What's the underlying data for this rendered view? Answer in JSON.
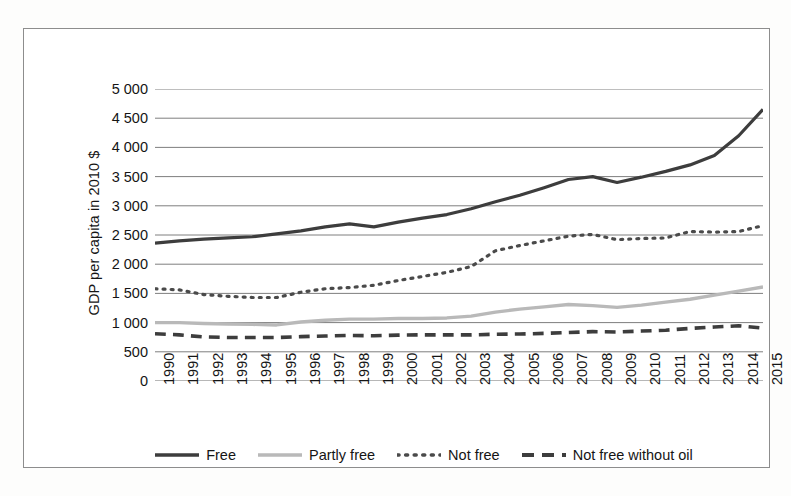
{
  "chart_data": {
    "type": "line",
    "title": "",
    "xlabel": "",
    "ylabel": "GDP per capita in 2010 $",
    "ylim": [
      0,
      5000
    ],
    "ytick_step": 500,
    "grid": true,
    "legend_position": "bottom",
    "ytick_labels": [
      "5 000",
      "4 500",
      "4 000",
      "3 500",
      "3 000",
      "2 500",
      "2 000",
      "1 500",
      "1 000",
      "500",
      "0"
    ],
    "ytick_values": [
      5000,
      4500,
      4000,
      3500,
      3000,
      2500,
      2000,
      1500,
      1000,
      500,
      0
    ],
    "categories": [
      "1990",
      "1991",
      "1992",
      "1993",
      "1994",
      "1995",
      "1996",
      "1997",
      "1998",
      "1999",
      "2000",
      "2001",
      "2002",
      "2003",
      "2004",
      "2005",
      "2006",
      "2007",
      "2008",
      "2009",
      "2010",
      "2011",
      "2012",
      "2013",
      "2014",
      "2015"
    ],
    "series": [
      {
        "name": "Free",
        "style": "solid",
        "color": "#3d3d3d",
        "width": 3.2,
        "values": [
          2360,
          2400,
          2430,
          2450,
          2470,
          2520,
          2570,
          2640,
          2690,
          2640,
          2720,
          2790,
          2850,
          2950,
          3070,
          3180,
          3310,
          3450,
          3500,
          3400,
          3490,
          3590,
          3700,
          3860,
          4200,
          4650
        ]
      },
      {
        "name": "Partly free",
        "style": "solid",
        "color": "#b9b9b9",
        "width": 3.4,
        "values": [
          1000,
          1000,
          985,
          975,
          970,
          960,
          1010,
          1040,
          1060,
          1060,
          1070,
          1070,
          1080,
          1110,
          1180,
          1230,
          1270,
          1310,
          1290,
          1260,
          1300,
          1350,
          1400,
          1470,
          1540,
          1610
        ]
      },
      {
        "name": "Not free",
        "style": "dotted",
        "color": "#4a4a4a",
        "width": 3.2,
        "values": [
          1580,
          1560,
          1480,
          1450,
          1430,
          1430,
          1520,
          1580,
          1600,
          1640,
          1720,
          1790,
          1860,
          1960,
          2230,
          2320,
          2400,
          2480,
          2510,
          2420,
          2440,
          2450,
          2560,
          2550,
          2560,
          2660
        ]
      },
      {
        "name": "Not free without oil",
        "style": "dashed",
        "color": "#3d3d3d",
        "width": 3.6,
        "values": [
          810,
          790,
          755,
          745,
          745,
          745,
          760,
          770,
          780,
          775,
          785,
          790,
          790,
          790,
          800,
          805,
          815,
          830,
          845,
          840,
          855,
          870,
          900,
          925,
          945,
          905
        ]
      }
    ]
  },
  "legend": {
    "items": [
      {
        "label": "Free",
        "style": "solid",
        "color": "#3d3d3d"
      },
      {
        "label": "Partly free",
        "style": "solid",
        "color": "#b9b9b9"
      },
      {
        "label": "Not free",
        "style": "dotted",
        "color": "#4a4a4a"
      },
      {
        "label": "Not free without oil",
        "style": "dashed",
        "color": "#3d3d3d"
      }
    ]
  }
}
